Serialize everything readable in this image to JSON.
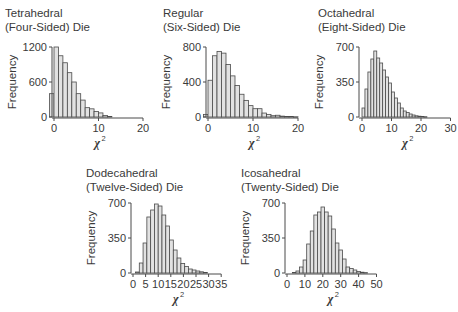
{
  "chart_data": [
    {
      "id": "tetrahedral",
      "type": "bar",
      "title": "Tetrahedral (Four-Sided) Die",
      "title_lines": [
        "Tetrahedral",
        "(Four-Sided) Die"
      ],
      "xlabel": "χ2",
      "ylabel": "Frequency",
      "xlim": [
        0,
        20
      ],
      "ylim": [
        0,
        1200
      ],
      "xticks": [
        0,
        10,
        20
      ],
      "yticks": [
        0,
        600,
        1200
      ],
      "bin_width": 1,
      "bin_start": -1,
      "values": [
        400,
        1200,
        1050,
        930,
        760,
        600,
        400,
        290,
        160,
        140,
        95,
        70,
        25,
        10
      ],
      "grid": false,
      "legend": null
    },
    {
      "id": "regular",
      "type": "bar",
      "title": "Regular (Six-Sided) Die",
      "title_lines": [
        "Regular",
        "(Six-Sided) Die"
      ],
      "xlabel": "χ2",
      "ylabel": "Frequency",
      "xlim": [
        0,
        20
      ],
      "ylim": [
        0,
        800
      ],
      "xticks": [
        0,
        10,
        20
      ],
      "yticks": [
        0,
        400,
        800
      ],
      "bin_width": 1,
      "bin_start": -1,
      "values": [
        30,
        420,
        700,
        750,
        730,
        600,
        470,
        360,
        260,
        190,
        130,
        95,
        95,
        45,
        30,
        15,
        20,
        10,
        5,
        5,
        3
      ],
      "grid": false,
      "legend": null
    },
    {
      "id": "octahedral",
      "type": "bar",
      "title": "Octahedral (Eight-Sided) Die",
      "title_lines": [
        "Octahedral",
        "(Eight-Sided) Die"
      ],
      "xlabel": "χ2",
      "ylabel": "Frequency",
      "xlim": [
        0,
        30
      ],
      "ylim": [
        0,
        700
      ],
      "xticks": [
        0,
        10,
        20,
        30
      ],
      "yticks": [
        0,
        350,
        700
      ],
      "bin_width": 1,
      "bin_start": 0,
      "values": [
        90,
        280,
        450,
        580,
        660,
        590,
        540,
        470,
        400,
        340,
        250,
        190,
        140,
        90,
        60,
        45,
        30,
        20,
        12,
        8,
        5,
        3
      ],
      "grid": false,
      "legend": null
    },
    {
      "id": "dodecahedral",
      "type": "bar",
      "title": "Dodecahedral (Twelve-Sided) Die",
      "title_lines": [
        "Dodecahedral",
        "(Twelve-Sided) Die"
      ],
      "xlabel": "χ2",
      "ylabel": "Frequency",
      "xlim": [
        0,
        35
      ],
      "ylim": [
        0,
        700
      ],
      "xticks": [
        0,
        5,
        10,
        15,
        20,
        25,
        30,
        35
      ],
      "yticks": [
        0,
        350,
        700
      ],
      "bin_width": 1.5,
      "bin_start": 1,
      "values": [
        10,
        100,
        300,
        560,
        630,
        690,
        670,
        580,
        470,
        330,
        230,
        150,
        95,
        65,
        40,
        30,
        20,
        12,
        6
      ],
      "grid": false,
      "legend": null
    },
    {
      "id": "icosahedral",
      "type": "bar",
      "title": "Icosahedral (Twenty-Sided) Die",
      "title_lines": [
        "Icosahedral",
        "(Twenty-Sided) Die"
      ],
      "xlabel": "χ2",
      "ylabel": "Frequency",
      "xlim": [
        0,
        50
      ],
      "ylim": [
        0,
        700
      ],
      "xticks": [
        0,
        10,
        20,
        30,
        40,
        50
      ],
      "yticks": [
        0,
        350,
        700
      ],
      "bin_width": 2,
      "bin_start": 3,
      "values": [
        5,
        20,
        60,
        130,
        290,
        420,
        580,
        610,
        660,
        610,
        570,
        440,
        300,
        230,
        140,
        60,
        45,
        30,
        15,
        8,
        4
      ],
      "grid": false,
      "legend": null
    }
  ],
  "layout": {
    "panels": [
      {
        "id": "tetrahedral",
        "title_x": 5,
        "title_y": 6,
        "axis_x": 52,
        "y_top": 47,
        "y_zero": 117,
        "x0": 54,
        "x_per_unit": 4.45
      },
      {
        "id": "regular",
        "title_x": 163,
        "title_y": 6,
        "axis_x": 206,
        "y_top": 47,
        "y_zero": 117,
        "x0": 208,
        "x_per_unit": 4.5
      },
      {
        "id": "octahedral",
        "title_x": 318,
        "title_y": 6,
        "axis_x": 359,
        "y_top": 47,
        "y_zero": 117,
        "x0": 362,
        "x_per_unit": 2.95
      },
      {
        "id": "dodecahedral",
        "title_x": 86,
        "title_y": 166,
        "axis_x": 131,
        "y_top": 203,
        "y_zero": 273,
        "x0": 133,
        "x_per_unit": 2.52
      },
      {
        "id": "icosahedral",
        "title_x": 241,
        "title_y": 166,
        "axis_x": 285,
        "y_top": 203,
        "y_zero": 273,
        "x0": 287,
        "x_per_unit": 1.79
      }
    ]
  },
  "colors": {
    "bar_fill": "#e2e2e2",
    "bar_stroke": "#4a4a4a",
    "axis": "#4a4a4a",
    "text": "#3a3a3a",
    "background": "#ffffff"
  }
}
